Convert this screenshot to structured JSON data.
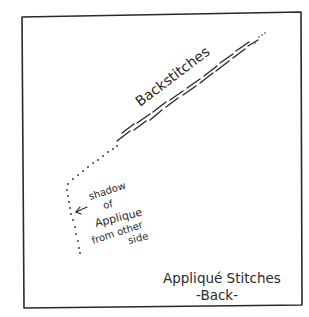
{
  "diagram": {
    "title": "Appliqué Stitches",
    "subtitle": "-Back-",
    "labels": {
      "backstitches": "Backstitches",
      "shadow": [
        "shadow",
        "of",
        "Applique",
        "from other",
        "side"
      ]
    },
    "colors": {
      "ink": "#2a2a2a",
      "background": "#ffffff"
    },
    "elements": [
      {
        "type": "frame",
        "description": "hand-drawn square fabric outline"
      },
      {
        "type": "stitch-line",
        "description": "diagonal row of backstitches on the back of the fabric"
      },
      {
        "type": "dotted-line",
        "description": "shadow of appliqué from other side"
      },
      {
        "type": "arrow",
        "direction": "left",
        "points_to": "dotted-line"
      }
    ]
  }
}
